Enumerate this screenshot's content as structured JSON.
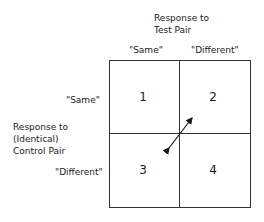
{
  "diagram": {
    "column_header": {
      "line1": "Response to",
      "line2": "Test Pair"
    },
    "columns": [
      "\"Same\"",
      "\"Different\""
    ],
    "row_header": {
      "line1": "Response to",
      "line2": "(Identical)",
      "line3": "Control Pair"
    },
    "rows": [
      "\"Same\"",
      "\"Different\""
    ],
    "cells": [
      "1",
      "2",
      "3",
      "4"
    ],
    "arrow": {
      "type": "double-headed",
      "between_cells": [
        "2",
        "3"
      ]
    }
  }
}
